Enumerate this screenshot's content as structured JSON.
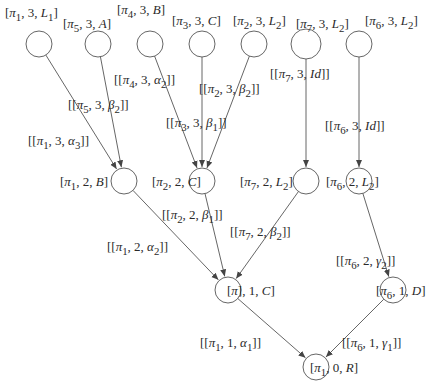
{
  "diagram": {
    "type": "tree",
    "nodes": [
      {
        "id": "n1",
        "label": "[π1, 3, L1]",
        "x": 39,
        "y": 44,
        "r": 13,
        "lx": 5,
        "ly": 6
      },
      {
        "id": "n2",
        "label": "[π5, 3, A]",
        "x": 98,
        "y": 44,
        "r": 13,
        "lx": 63,
        "ly": 17
      },
      {
        "id": "n3",
        "label": "[π4, 3, B]",
        "x": 150,
        "y": 44,
        "r": 13,
        "lx": 117,
        "ly": 3
      },
      {
        "id": "n4",
        "label": "[π3, 3, C]",
        "x": 202,
        "y": 44,
        "r": 13,
        "lx": 172,
        "ly": 14
      },
      {
        "id": "n5",
        "label": "[π2, 3, L2]",
        "x": 254,
        "y": 44,
        "r": 13,
        "lx": 233,
        "ly": 14
      },
      {
        "id": "n6",
        "label": "[π7, 3, L2]",
        "x": 306,
        "y": 44,
        "r": 15,
        "lx": 296,
        "ly": 17
      },
      {
        "id": "n7",
        "label": "[π6, 3, L2]",
        "x": 359,
        "y": 44,
        "r": 13,
        "lx": 365,
        "ly": 14
      },
      {
        "id": "n8",
        "label": "[π1, 2, B]",
        "x": 124,
        "y": 181,
        "r": 13,
        "lx": 60,
        "ly": 175
      },
      {
        "id": "n9",
        "label": "[π2, 2, C]",
        "x": 202,
        "y": 181,
        "r": 13,
        "lx": 152,
        "ly": 175
      },
      {
        "id": "n10",
        "label": "[π7, 2, L2]",
        "x": 306,
        "y": 181,
        "r": 13,
        "lx": 240,
        "ly": 175
      },
      {
        "id": "n11",
        "label": "[π6, 2, L2]",
        "x": 359,
        "y": 181,
        "r": 13,
        "lx": 326,
        "ly": 175
      },
      {
        "id": "n12",
        "label": "[π], 1, C]",
        "x": 228,
        "y": 290,
        "r": 13,
        "lx": 227,
        "ly": 284
      },
      {
        "id": "n13",
        "label": "[π6, 1, D]",
        "x": 393,
        "y": 290,
        "r": 13,
        "lx": 376,
        "ly": 284
      },
      {
        "id": "n14",
        "label": "[π1, 0, R]",
        "x": 316,
        "y": 367,
        "r": 13,
        "lx": 310,
        "ly": 361
      }
    ],
    "edges": [
      {
        "from": "n1",
        "to": "n8",
        "label": "[[π1, 3, α3]]",
        "lx": 28,
        "ly": 134
      },
      {
        "from": "n2",
        "to": "n8",
        "label": "[[π5, 3, β2]]",
        "lx": 68,
        "ly": 98
      },
      {
        "from": "n3",
        "to": "n9",
        "label": "[[π4, 3, α2]]",
        "lx": 114,
        "ly": 73
      },
      {
        "from": "n4",
        "to": "n9",
        "label": "[[π3, 3, β1]]",
        "lx": 166,
        "ly": 116
      },
      {
        "from": "n5",
        "to": "n9",
        "label": "[[π2, 3, β2]]",
        "lx": 199,
        "ly": 82
      },
      {
        "from": "n6",
        "to": "n10",
        "label": "[[π7, 3, Id]]",
        "lx": 270,
        "ly": 67
      },
      {
        "from": "n7",
        "to": "n11",
        "label": "[[π6, 3, Id]]",
        "lx": 325,
        "ly": 119
      },
      {
        "from": "n8",
        "to": "n12",
        "label": "[[π1, 2, α2]]",
        "lx": 107,
        "ly": 240
      },
      {
        "from": "n9",
        "to": "n12",
        "label": "[[π2, 2, β1]]",
        "lx": 162,
        "ly": 208
      },
      {
        "from": "n10",
        "to": "n12",
        "label": "[[π7, 2, β2]]",
        "lx": 230,
        "ly": 225
      },
      {
        "from": "n11",
        "to": "n13",
        "label": "[[π6, 2, γ2]]",
        "lx": 336,
        "ly": 254
      },
      {
        "from": "n12",
        "to": "n14",
        "label": "[[π1, 1, α1]]",
        "lx": 200,
        "ly": 336
      },
      {
        "from": "n13",
        "to": "n14",
        "label": "[[π6, 1, γ1]]",
        "lx": 342,
        "ly": 336
      }
    ]
  },
  "labels_html": {
    "n1": "[<i>π</i><sub>1</sub>, 3, <i>L</i><sub>1</sub>]",
    "n2": "[<i>π</i><sub>5</sub>, 3, <i>A</i>]",
    "n3": "[<i>π</i><sub>4</sub>, 3, <i>B</i>]",
    "n4": "[<i>π</i><sub>3</sub>, 3, <i>C</i>]",
    "n5": "[<i>π</i><sub>2</sub>, 3, <i>L</i><sub>2</sub>]",
    "n6": "[<i>π</i><sub>7</sub>, 3, <i>L</i><sub>2</sub>]",
    "n7": "[<i>π</i><sub>6</sub>, 3, <i>L</i><sub>2</sub>]",
    "n8": "[<i>π</i><sub>1</sub>, 2, <i>B</i>]",
    "n9": "[<i>π</i><sub>2</sub>, 2, <i>C</i>]",
    "n10": "[<i>π</i><sub>7</sub>, 2, <i>L</i><sub>2</sub>]",
    "n11": "[<i>π</i><sub>6</sub>, 2, <i>L</i><sub>2</sub>]",
    "n12": "[<i>π</i>], 1, <i>C</i>]",
    "n13": "[<i>π</i><sub>6</sub>, 1, <i>D</i>]",
    "n14": "[<i>π</i><sub>1</sub>, 0, <i>R</i>]",
    "e0": "[[<i>π</i><sub>1</sub>, 3, <i>α</i><sub>3</sub>]]",
    "e1": "[[<i>π</i><sub>5</sub>, 3, <i>β</i><sub>2</sub>]]",
    "e2": "[[<i>π</i><sub>4</sub>, 3, <i>α</i><sub>2</sub>]]",
    "e3": "[[<i>π</i><sub>3</sub>, 3, <i>β</i><sub>1</sub>]]",
    "e4": "[[<i>π</i><sub>2</sub>, 3, <i>β</i><sub>2</sub>]]",
    "e5": "[[<i>π</i><sub>7</sub>, 3, <i>Id</i>]]",
    "e6": "[[<i>π</i><sub>6</sub>, 3, <i>Id</i>]]",
    "e7": "[[<i>π</i><sub>1</sub>, 2, <i>α</i><sub>2</sub>]]",
    "e8": "[[<i>π</i><sub>2</sub>, 2, <i>β</i><sub>1</sub>]]",
    "e9": "[[<i>π</i><sub>7</sub>, 2, <i>β</i><sub>2</sub>]]",
    "e10": "[[<i>π</i><sub>6</sub>, 2, <i>γ</i><sub>2</sub>]]",
    "e11": "[[<i>π</i><sub>1</sub>, 1, <i>α</i><sub>1</sub>]]",
    "e12": "[[<i>π</i><sub>6</sub>, 1, <i>γ</i><sub>1</sub>]]"
  },
  "colors": {
    "stroke": "#555555",
    "text": "#2a2a2a",
    "background": "#ffffff"
  }
}
